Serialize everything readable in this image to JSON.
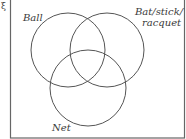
{
  "diagram": {
    "type": "venn",
    "universal_set_symbol": "ξ",
    "sets": [
      {
        "id": "ball",
        "label": "Ball"
      },
      {
        "id": "bat",
        "label_lines": [
          "Bat/stick/",
          "racquet"
        ]
      },
      {
        "id": "net",
        "label": "Net"
      }
    ],
    "colors": {
      "stroke": "#555555",
      "frame": "#666666",
      "text": "#3a3a3a"
    }
  }
}
